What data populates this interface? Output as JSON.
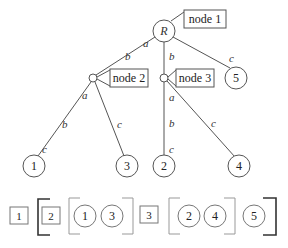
{
  "diagram": {
    "title": "",
    "tree": {
      "root": {
        "label": "R",
        "tag": "node 1"
      },
      "internal_nodes": [
        {
          "id": "node2",
          "tag": "node 2"
        },
        {
          "id": "node3",
          "tag": "node 3"
        }
      ],
      "leaves": [
        {
          "id": "leaf1",
          "label": "1"
        },
        {
          "id": "leaf3",
          "label": "3"
        },
        {
          "id": "leaf2",
          "label": "2"
        },
        {
          "id": "leaf4",
          "label": "4"
        },
        {
          "id": "leaf5",
          "label": "5"
        }
      ],
      "edges": [
        {
          "from": "R",
          "to": "node2",
          "labels": [
            "a",
            "b"
          ]
        },
        {
          "from": "R",
          "to": "node3",
          "labels": [
            "b"
          ]
        },
        {
          "from": "R",
          "to": "leaf5",
          "labels": [
            "c"
          ]
        },
        {
          "from": "node2",
          "to": "leaf1",
          "labels": [
            "a",
            "b",
            "c"
          ]
        },
        {
          "from": "node2",
          "to": "leaf3",
          "labels": [
            "c"
          ]
        },
        {
          "from": "node3",
          "to": "leaf2",
          "labels": [
            "a",
            "b",
            "c"
          ]
        },
        {
          "from": "node3",
          "to": "leaf4",
          "labels": [
            "c"
          ]
        }
      ]
    },
    "serialization": {
      "items": [
        "1",
        "2",
        "1",
        "3",
        "3",
        "2",
        "4",
        "5"
      ],
      "boxes": [
        "1",
        "2",
        "3"
      ],
      "circles": [
        "1",
        "3",
        "2",
        "4",
        "5"
      ]
    }
  }
}
